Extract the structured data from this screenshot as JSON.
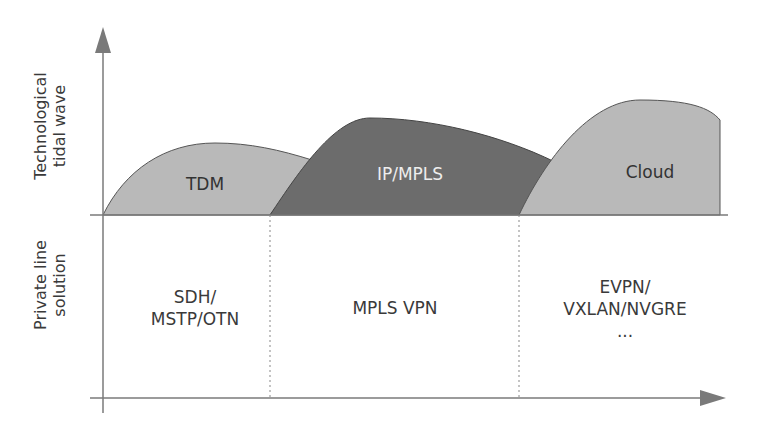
{
  "axes": {
    "y_top_label_line1": "Technological",
    "y_top_label_line2": "tidal wave",
    "y_bottom_label_line1": "Private line",
    "y_bottom_label_line2": "solution"
  },
  "waves": [
    {
      "label": "TDM",
      "fill": "#b9b9b9",
      "text_color": "#333333"
    },
    {
      "label": "IP/MPLS",
      "fill": "#6c6c6c",
      "text_color": "#eeeeee"
    },
    {
      "label": "Cloud",
      "fill": "#b9b9b9",
      "text_color": "#333333"
    }
  ],
  "solutions": [
    {
      "line1": "SDH/",
      "line2": "MSTP/OTN",
      "line3": ""
    },
    {
      "line1": "MPLS VPN",
      "line2": "",
      "line3": ""
    },
    {
      "line1": "EVPN/",
      "line2": "VXLAN/NVGRE",
      "line3": "..."
    }
  ],
  "colors": {
    "axis": "#7a7a7a",
    "outline": "#555555"
  }
}
